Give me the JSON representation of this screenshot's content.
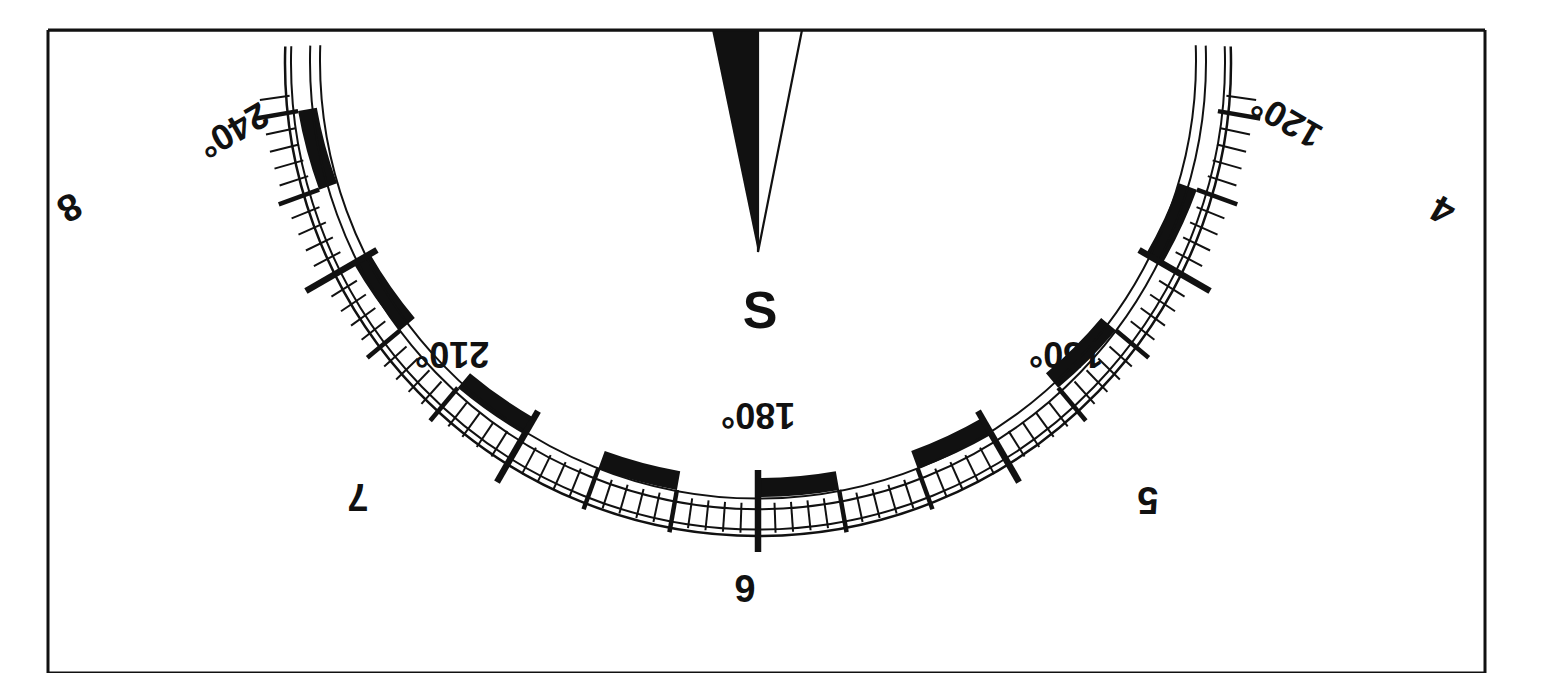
{
  "figure": {
    "kind": "compass-card-lower-half",
    "background_color": "#ffffff",
    "ink_color": "#111111",
    "frame": {
      "x": 48,
      "y": 30,
      "width": 1437,
      "height": 643,
      "stroke_width": 3
    }
  },
  "compass": {
    "center_x": 758,
    "center_y": 30,
    "inner_circle_radius": 438,
    "band_inner_radius": 448,
    "band_outer_radius": 467,
    "outer_circle_radius": 473,
    "minor_tick_outer_radius": 503,
    "medium_tick_outer_radius": 510,
    "major_tick_outer_radius": 522,
    "major_tick_inner_radius": 440,
    "minor_tick_step_degrees": 2,
    "medium_tick_step_degrees": 10,
    "major_tick_step_degrees": 30,
    "band_segment_degrees": 10,
    "band_segment_start_degrees": 110,
    "visible_arc_start_degrees": 98,
    "visible_arc_end_degrees": 262
  },
  "needle": {
    "label": "S",
    "heading_degrees": 180,
    "tip_x": 758,
    "tip_y": 252,
    "base_left_x": 712,
    "base_right_x": 802,
    "base_y": 30,
    "dark_half_color": "#111111",
    "light_half_color": "#ffffff",
    "label_x": 760,
    "label_y": 314,
    "label_font_size": 52
  },
  "degree_labels": [
    {
      "text": "120°",
      "degrees": 120,
      "x": 1288,
      "y": 118,
      "rotation": -150,
      "font_size": 36
    },
    {
      "text": "150°",
      "degrees": 150,
      "x": 1066,
      "y": 352,
      "rotation": 180,
      "font_size": 36
    },
    {
      "text": "180°",
      "degrees": 180,
      "x": 758,
      "y": 413,
      "rotation": 180,
      "font_size": 36
    },
    {
      "text": "210°",
      "degrees": 210,
      "x": 452,
      "y": 352,
      "rotation": 180,
      "font_size": 36
    },
    {
      "text": "240°",
      "degrees": 240,
      "x": 232,
      "y": 128,
      "rotation": 150,
      "font_size": 36
    }
  ],
  "point_labels": [
    {
      "text": "4",
      "degrees": 120,
      "x": 1444,
      "y": 208,
      "rotation": 210,
      "font_size": 38
    },
    {
      "text": "5",
      "degrees": 150,
      "x": 1148,
      "y": 497,
      "rotation": 180,
      "font_size": 38
    },
    {
      "text": "6",
      "degrees": 180,
      "x": 745,
      "y": 585,
      "rotation": 180,
      "font_size": 38
    },
    {
      "text": "7",
      "degrees": 210,
      "x": 358,
      "y": 494,
      "rotation": 180,
      "font_size": 38
    },
    {
      "text": "8",
      "degrees": 240,
      "x": 68,
      "y": 205,
      "rotation": 150,
      "font_size": 38
    }
  ],
  "legend": {
    "title": "Compass card",
    "cardinal_point": "S",
    "degree_unit": "°",
    "degree_range": "120° – 240°",
    "point_range": "4 – 8"
  }
}
